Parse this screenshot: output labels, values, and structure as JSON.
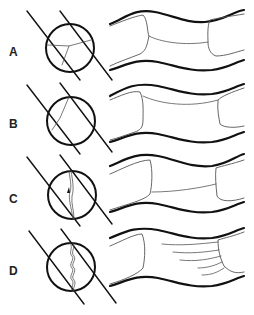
{
  "figure": {
    "panels": [
      {
        "label": "A",
        "description": "Three-way junction of boundaries within circle; tube with two end caps joined by a connecting line"
      },
      {
        "label": "B",
        "description": "Single angled boundary within circle; tube with connecting line near top"
      },
      {
        "label": "C",
        "description": "Near-vertical boundary with small triangle marker; tube with straight connecting line"
      },
      {
        "label": "D",
        "description": "Wavy vertical boundary; tube with multiple fanned lines"
      }
    ]
  },
  "colors": {
    "stroke": "#111111",
    "thin": "#444444",
    "background": "#ffffff"
  }
}
